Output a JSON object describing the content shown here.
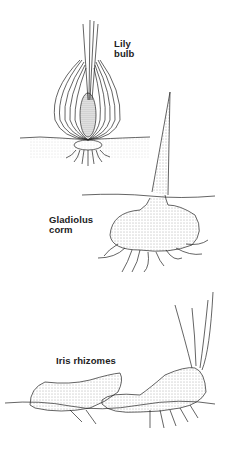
{
  "figures": [
    {
      "label_line1": "Lily",
      "label_line2": "bulb"
    },
    {
      "label_line1": "Gladiolus",
      "label_line2": "corm"
    },
    {
      "label_line1": "Iris rhizomes"
    }
  ]
}
